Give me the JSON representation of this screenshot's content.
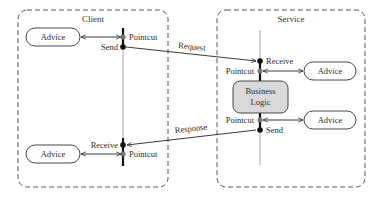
{
  "diagram": {
    "client": {
      "title": "Client",
      "advice_top": "Advice",
      "advice_bottom": "Advice",
      "pointcut_top": "Pointcut",
      "send": "Send",
      "receive": "Receive",
      "pointcut_bottom": "Pointcut"
    },
    "service": {
      "title": "Service",
      "receive": "Receive",
      "pointcut_top": "Pointcut",
      "advice_top": "Advice",
      "business_logic_line1": "Business",
      "business_logic_line2": "Logic",
      "pointcut_bottom": "Pointcut",
      "send": "Send",
      "advice_bottom": "Advice"
    },
    "messages": {
      "request": "Request",
      "response": "Response"
    },
    "colors": {
      "business_logic_fill": "#d9d9d9",
      "pointcut_dot": "#777777",
      "event_dot": "#111111"
    }
  }
}
